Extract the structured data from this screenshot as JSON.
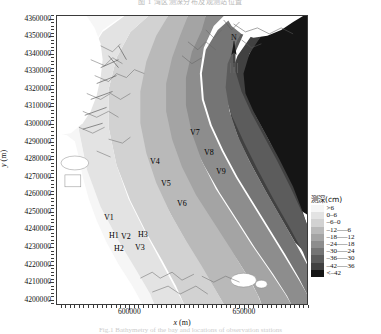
{
  "figure": {
    "top_caption": "图 1  湾区测深分布及观测站位置",
    "bottom_caption": "Fig.1  Bathymetry of the bay and locations of observation stations"
  },
  "axes": {
    "x_label_italic": "x",
    "x_label_unit": " (m)",
    "y_label_italic": "y",
    "y_label_unit": " (m)",
    "x_ticks": [
      "600000",
      "650000"
    ],
    "x_tick_values": [
      600000,
      650000
    ],
    "x_range": [
      568000,
      678000
    ],
    "y_ticks": [
      "4360000",
      "4350000",
      "4340000",
      "4330000",
      "4320000",
      "4310000",
      "4300000",
      "4290000",
      "4280000",
      "4270000",
      "4260000",
      "4250000",
      "4240000",
      "4230000",
      "4220000",
      "4210000",
      "4200000"
    ],
    "y_tick_values": [
      4360000,
      4350000,
      4340000,
      4330000,
      4320000,
      4310000,
      4300000,
      4290000,
      4280000,
      4270000,
      4260000,
      4250000,
      4240000,
      4230000,
      4220000,
      4210000,
      4200000
    ],
    "y_range": [
      4197000,
      4362000
    ]
  },
  "north_arrow": {
    "label": "N"
  },
  "stations": [
    {
      "name": "V1",
      "x": 103,
      "y": 212
    },
    {
      "name": "V2",
      "x": 120,
      "y": 231
    },
    {
      "name": "V3",
      "x": 134,
      "y": 242
    },
    {
      "name": "V4",
      "x": 149,
      "y": 156
    },
    {
      "name": "V5",
      "x": 160,
      "y": 178
    },
    {
      "name": "V6",
      "x": 176,
      "y": 198
    },
    {
      "name": "V7",
      "x": 189,
      "y": 127
    },
    {
      "name": "V8",
      "x": 203,
      "y": 147
    },
    {
      "name": "V9",
      "x": 215,
      "y": 166
    },
    {
      "name": "H1",
      "x": 108,
      "y": 230
    },
    {
      "name": "H2",
      "x": 113,
      "y": 243
    },
    {
      "name": "H3",
      "x": 137,
      "y": 229
    }
  ],
  "legend": {
    "title": "测深(cm)",
    "entries": [
      {
        "label": ">6",
        "color": "#f6f6f6"
      },
      {
        "label": "0–6",
        "color": "#e3e3e3"
      },
      {
        "label": "–6–0",
        "color": "#d2d2d2"
      },
      {
        "label": "–12—–6",
        "color": "#b9b9b9"
      },
      {
        "label": "–18—–12",
        "color": "#a4a4a4"
      },
      {
        "label": "–24—–18",
        "color": "#8d8d8d"
      },
      {
        "label": "–30—–24",
        "color": "#757575"
      },
      {
        "label": "–36—–30",
        "color": "#5c5c5c"
      },
      {
        "label": "–42—–36",
        "color": "#414141"
      },
      {
        "label": "<–42",
        "color": "#151515"
      }
    ]
  },
  "chart_data": {
    "type": "heatmap",
    "title": "Bathymetry of the bay and locations of observation stations",
    "xlabel": "x (m)",
    "ylabel": "y (m)",
    "xlim": [
      568000,
      678000
    ],
    "ylim": [
      4197000,
      4362000
    ],
    "grid": false,
    "legend_position": "right",
    "colorbar_label": "测深(cm)",
    "band_edges_cm": [
      6,
      0,
      -6,
      -12,
      -18,
      -24,
      -30,
      -36,
      -42
    ],
    "band_labels": [
      ">6",
      "0–6",
      "–6–0",
      "–12—–6",
      "–18—–12",
      "–24—–18",
      "–30—–24",
      "–36—–30",
      "–42—–36",
      "<–42"
    ],
    "band_colors": [
      "#f6f6f6",
      "#e3e3e3",
      "#d2d2d2",
      "#b9b9b9",
      "#a4a4a4",
      "#8d8d8d",
      "#757575",
      "#5c5c5c",
      "#414141",
      "#151515"
    ],
    "station_points": [
      {
        "name": "V1",
        "x": 588000,
        "y": 4254000
      },
      {
        "name": "V2",
        "x": 595000,
        "y": 4246000
      },
      {
        "name": "V3",
        "x": 601000,
        "y": 4240000
      },
      {
        "name": "V4",
        "x": 608000,
        "y": 4289000
      },
      {
        "name": "V5",
        "x": 613000,
        "y": 4276000
      },
      {
        "name": "V6",
        "x": 620000,
        "y": 4265000
      },
      {
        "name": "V7",
        "x": 626000,
        "y": 4305000
      },
      {
        "name": "V8",
        "x": 632000,
        "y": 4294000
      },
      {
        "name": "V9",
        "x": 637000,
        "y": 4283000
      },
      {
        "name": "H1",
        "x": 590000,
        "y": 4247000
      },
      {
        "name": "H2",
        "x": 592000,
        "y": 4239000
      },
      {
        "name": "H3",
        "x": 603000,
        "y": 4247000
      }
    ]
  }
}
